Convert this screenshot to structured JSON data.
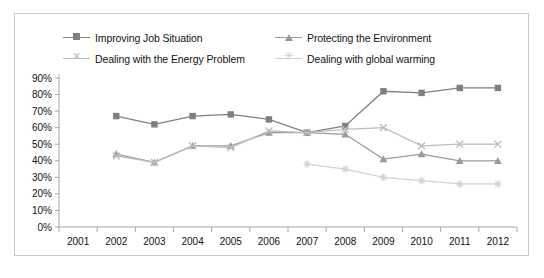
{
  "chart_data": {
    "type": "line",
    "title": "",
    "subtitle": "",
    "xlabel": "",
    "ylabel": "",
    "x": [
      "2001",
      "2002",
      "2003",
      "2004",
      "2005",
      "2006",
      "2007",
      "2008",
      "2009",
      "2010",
      "2011",
      "2012"
    ],
    "categories": [
      "2001",
      "2002",
      "2003",
      "2004",
      "2005",
      "2006",
      "2007",
      "2008",
      "2009",
      "2010",
      "2011",
      "2012"
    ],
    "ylim": [
      0,
      90
    ],
    "ytick_labels": [
      "90%",
      "80%",
      "70%",
      "60%",
      "50%",
      "40%",
      "30%",
      "20%",
      "10%",
      "0%"
    ],
    "ytick_values": [
      90,
      80,
      70,
      60,
      50,
      40,
      30,
      20,
      10,
      0
    ],
    "grid": false,
    "legend_position": "top",
    "value_unit": "percent",
    "series": [
      {
        "name": "Improving Job Situation",
        "marker": "square",
        "color": "#7f7f7f",
        "x": [
          "2002",
          "2003",
          "2004",
          "2005",
          "2006",
          "2007",
          "2008",
          "2009",
          "2010",
          "2011",
          "2012"
        ],
        "values": [
          67,
          62,
          67,
          68,
          65,
          57,
          61,
          82,
          81,
          84,
          84
        ]
      },
      {
        "name": "Protecting the Environment",
        "marker": "triangle",
        "color": "#9a9a9a",
        "x": [
          "2002",
          "2003",
          "2004",
          "2005",
          "2006",
          "2007",
          "2008",
          "2009",
          "2010",
          "2011",
          "2012"
        ],
        "values": [
          44,
          39,
          49,
          49,
          57,
          57,
          56,
          41,
          44,
          40,
          40
        ]
      },
      {
        "name": "Dealing with the Energy Problem",
        "marker": "x",
        "color": "#bdbdbd",
        "x": [
          "2002",
          "2003",
          "2004",
          "2005",
          "2006",
          "2007",
          "2008",
          "2009",
          "2010",
          "2011",
          "2012"
        ],
        "values": [
          43,
          39,
          49,
          48,
          58,
          57,
          59,
          60,
          49,
          50,
          50
        ]
      },
      {
        "name": "Dealing with global warming",
        "marker": "star",
        "color": "#d2d2d2",
        "x": [
          "2007",
          "2008",
          "2009",
          "2010",
          "2011",
          "2012"
        ],
        "values": [
          38,
          35,
          30,
          28,
          26,
          26
        ]
      }
    ]
  },
  "legend": {
    "rows": [
      [
        {
          "label": "Improving Job Situation",
          "marker": "square",
          "color": "#7f7f7f",
          "glyph": ""
        },
        {
          "label": "Protecting the Environment",
          "marker": "triangle",
          "color": "#9a9a9a",
          "glyph": ""
        }
      ],
      [
        {
          "label": "Dealing with the Energy Problem",
          "marker": "x",
          "color": "#bdbdbd",
          "glyph": "✕"
        },
        {
          "label": "Dealing with global warming",
          "marker": "star",
          "color": "#d2d2d2",
          "glyph": "✳"
        }
      ]
    ]
  }
}
